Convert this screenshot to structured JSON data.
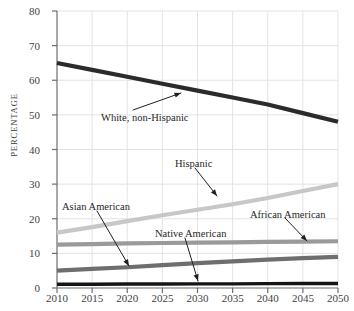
{
  "chart_data": {
    "type": "line",
    "title": "",
    "xlabel": "",
    "ylabel": "PERCENTAGE",
    "xlim": [
      2010,
      2050
    ],
    "ylim": [
      0,
      80
    ],
    "grid": true,
    "legend_position": "inline-annotations",
    "x": [
      2010,
      2015,
      2020,
      2025,
      2030,
      2035,
      2040,
      2045,
      2050
    ],
    "xticklabels": [
      "2010",
      "2015",
      "2020",
      "2025",
      "2030",
      "2035",
      "2040",
      "2045",
      "2050"
    ],
    "yticklabels": [
      "0",
      "10",
      "20",
      "30",
      "40",
      "50",
      "60",
      "70",
      "80"
    ],
    "yticks": [
      0,
      10,
      20,
      30,
      40,
      50,
      60,
      70,
      80
    ],
    "series": [
      {
        "name": "White, non-Hispanic",
        "color": "#2b2b2b",
        "width": 4.2,
        "values": [
          65,
          63,
          61,
          59,
          57,
          55,
          53,
          50.5,
          48
        ]
      },
      {
        "name": "Hispanic",
        "color": "#c7c7c7",
        "width": 4.2,
        "values": [
          16,
          17.6,
          19.3,
          21,
          22.6,
          24.2,
          26,
          28,
          30
        ]
      },
      {
        "name": "African American",
        "color": "#9a9a9a",
        "width": 4.2,
        "values": [
          12.5,
          12.7,
          12.9,
          13,
          13.1,
          13.2,
          13.3,
          13.4,
          13.5
        ]
      },
      {
        "name": "Asian American",
        "color": "#6e6e6e",
        "width": 4.2,
        "values": [
          5,
          5.5,
          6,
          6.6,
          7.2,
          7.7,
          8.2,
          8.6,
          9
        ]
      },
      {
        "name": "Native American",
        "color": "#141414",
        "width": 3.4,
        "values": [
          1.1,
          1.1,
          1.15,
          1.15,
          1.2,
          1.2,
          1.25,
          1.3,
          1.3
        ]
      }
    ],
    "annotations": [
      {
        "label": "White, non-Hispanic",
        "label_x": 101,
        "label_y": 112,
        "arrow_from_x": 133,
        "arrow_from_y": 110,
        "arrow_to_x": 181,
        "arrow_to_y": 93
      },
      {
        "label": "Hispanic",
        "label_x": 175,
        "label_y": 158,
        "arrow_from_x": 195,
        "arrow_from_y": 168,
        "arrow_to_x": 217,
        "arrow_to_y": 196
      },
      {
        "label": "African American",
        "label_x": 250,
        "label_y": 209,
        "arrow_from_x": 285,
        "arrow_from_y": 218,
        "arrow_to_x": 307,
        "arrow_to_y": 241
      },
      {
        "label": "Asian American",
        "label_x": 62,
        "label_y": 201,
        "arrow_from_x": 97,
        "arrow_from_y": 211,
        "arrow_to_x": 129,
        "arrow_to_y": 266
      },
      {
        "label": "Native American",
        "label_x": 155,
        "label_y": 228,
        "arrow_from_x": 185,
        "arrow_from_y": 238,
        "arrow_to_x": 198,
        "arrow_to_y": 281
      }
    ],
    "colors": {
      "axis": "#6d6d6d",
      "grid": "#e3e3e3",
      "text": "#3f3f3f",
      "background": "#ffffff"
    }
  }
}
